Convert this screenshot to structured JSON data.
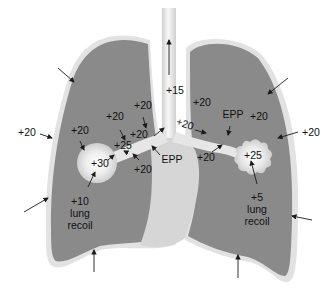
{
  "colors": {
    "lung_tissue": "#8a8a8a",
    "lung_tissue_dark": "#767676",
    "pleura": "#e2e2e2",
    "airway": "#dcdcdc",
    "airway_highlight": "#f6f6f6",
    "mediastinum": "#d6d6d6",
    "arrow": "#1a1a1a",
    "text": "#111111"
  },
  "labels": {
    "trachea_pressure": "+15",
    "left_outside": "+20",
    "right_outside": "+20",
    "left_upper_1": "+20",
    "left_upper_2": "+20",
    "left_upper_3": "+20",
    "left_airway": "+20",
    "left_airway_25": "+25",
    "left_airway_below": "+20",
    "left_alveolus": "+30",
    "left_epp": "EPP",
    "left_recoil": "+10\nlung\nrecoil",
    "right_upper": "+20",
    "right_airway": "+20",
    "right_epp": "EPP",
    "right_tissue": "+20",
    "right_airway_below": "+20",
    "right_alveolus": "+25",
    "right_recoil": "+5\nlung\nrecoil"
  }
}
